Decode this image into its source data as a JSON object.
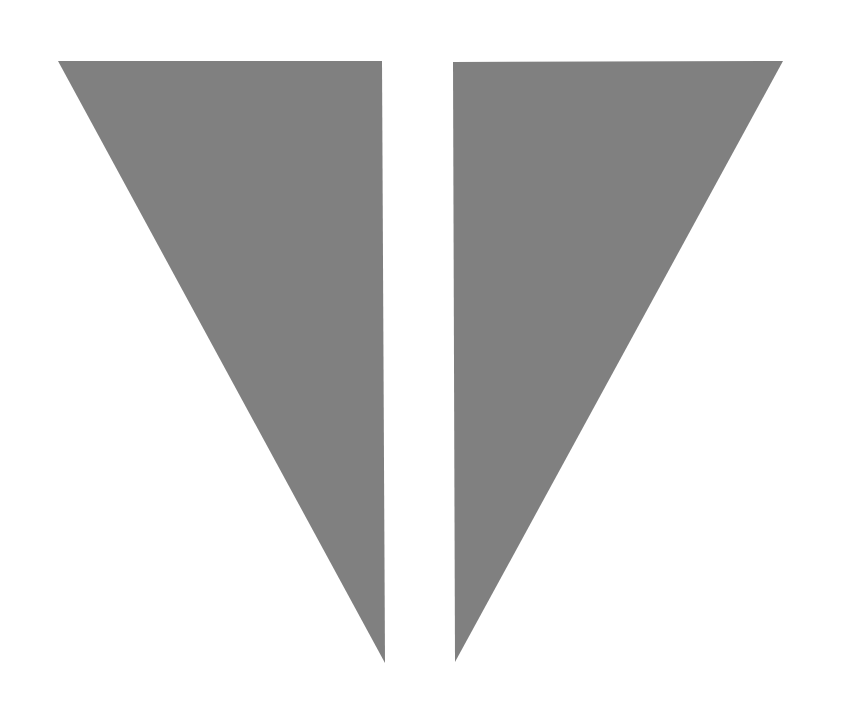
{
  "canvas": {
    "width": 842,
    "height": 701,
    "background_color": "#ffffff",
    "title": "Two Gray Triangles"
  },
  "figure": {
    "fill_color": "#808080",
    "stroke": "none",
    "shape_count": 2
  },
  "shapes": [
    {
      "name": "left-triangle",
      "label": "Left Triangle",
      "fill_color": "#808080",
      "points": "58,61 382,61 385,663",
      "vertices": [
        {
          "x": 58,
          "y": 61,
          "name": "top-left-vertex"
        },
        {
          "x": 382,
          "y": 61,
          "name": "top-right-vertex"
        },
        {
          "x": 385,
          "y": 663,
          "name": "bottom-tip-vertex"
        }
      ]
    },
    {
      "name": "right-triangle",
      "label": "Right Triangle",
      "fill_color": "#808080",
      "points": "453,62 783,61 455,662",
      "vertices": [
        {
          "x": 453,
          "y": 62,
          "name": "top-left-vertex"
        },
        {
          "x": 783,
          "y": 61,
          "name": "top-right-vertex"
        },
        {
          "x": 455,
          "y": 662,
          "name": "bottom-tip-vertex"
        }
      ]
    }
  ]
}
